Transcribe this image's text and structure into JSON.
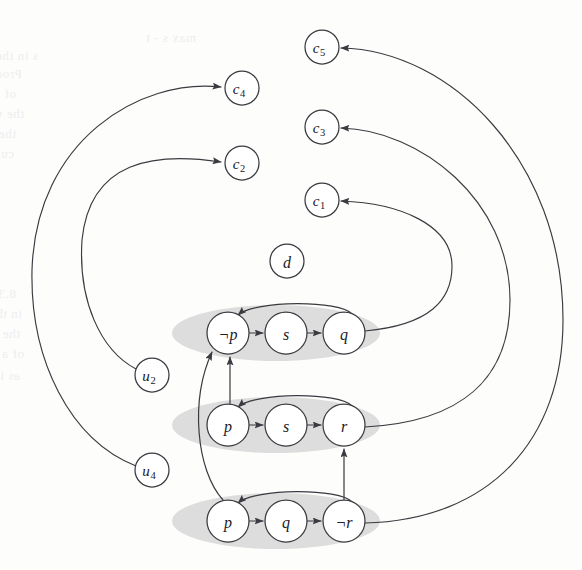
{
  "figure": {
    "background_color": "#fdfdfc",
    "cluster_fill": "#c9c9c9",
    "node_fill": "#ffffff",
    "stroke_color": "#3a3a40",
    "width": 582,
    "height": 570
  },
  "nodes": [
    {
      "id": "c5",
      "label": "c",
      "sub": "5",
      "cx": 322,
      "cy": 47,
      "r": 17,
      "group": "clause"
    },
    {
      "id": "c3",
      "label": "c",
      "sub": "3",
      "cx": 322,
      "cy": 127,
      "r": 17,
      "group": "clause"
    },
    {
      "id": "c1",
      "label": "c",
      "sub": "1",
      "cx": 322,
      "cy": 200,
      "r": 17,
      "group": "clause"
    },
    {
      "id": "c4",
      "label": "c",
      "sub": "4",
      "cx": 242,
      "cy": 88,
      "r": 17,
      "group": "clause"
    },
    {
      "id": "c2",
      "label": "c",
      "sub": "2",
      "cx": 242,
      "cy": 163,
      "r": 17,
      "group": "clause"
    },
    {
      "id": "d",
      "label": "d",
      "sub": "",
      "cx": 287,
      "cy": 261,
      "r": 17,
      "group": "isolated"
    },
    {
      "id": "u2",
      "label": "u",
      "sub": "2",
      "cx": 152,
      "cy": 375,
      "r": 17,
      "group": "unit"
    },
    {
      "id": "u4",
      "label": "u",
      "sub": "4",
      "cx": 152,
      "cy": 470,
      "r": 17,
      "group": "unit"
    },
    {
      "id": "n1a",
      "label": "¬p",
      "sub": "",
      "cx": 228,
      "cy": 333,
      "r": 21,
      "group": "scc1"
    },
    {
      "id": "n1b",
      "label": "s",
      "sub": "",
      "cx": 286,
      "cy": 333,
      "r": 21,
      "group": "scc1"
    },
    {
      "id": "n1c",
      "label": "q",
      "sub": "",
      "cx": 344,
      "cy": 333,
      "r": 21,
      "group": "scc1"
    },
    {
      "id": "n2a",
      "label": "p",
      "sub": "",
      "cx": 228,
      "cy": 425,
      "r": 21,
      "group": "scc2"
    },
    {
      "id": "n2b",
      "label": "s",
      "sub": "",
      "cx": 286,
      "cy": 425,
      "r": 21,
      "group": "scc2"
    },
    {
      "id": "n2c",
      "label": "r",
      "sub": "",
      "cx": 344,
      "cy": 425,
      "r": 21,
      "group": "scc2"
    },
    {
      "id": "n3a",
      "label": "p",
      "sub": "",
      "cx": 228,
      "cy": 521,
      "r": 21,
      "group": "scc3"
    },
    {
      "id": "n3b",
      "label": "q",
      "sub": "",
      "cx": 286,
      "cy": 521,
      "r": 21,
      "group": "scc3"
    },
    {
      "id": "n3c",
      "label": "¬r",
      "sub": "",
      "cx": 344,
      "cy": 521,
      "r": 21,
      "group": "scc3"
    }
  ],
  "clusters": [
    {
      "id": "scc1",
      "cx": 276,
      "cy": 333,
      "rx": 104,
      "ry": 28,
      "members": [
        "n1a",
        "n1b",
        "n1c"
      ]
    },
    {
      "id": "scc2",
      "cx": 276,
      "cy": 425,
      "rx": 104,
      "ry": 28,
      "members": [
        "n2a",
        "n2b",
        "n2c"
      ]
    },
    {
      "id": "scc3",
      "cx": 276,
      "cy": 521,
      "rx": 104,
      "ry": 28,
      "members": [
        "n3a",
        "n3b",
        "n3c"
      ]
    }
  ],
  "edges": [
    {
      "id": "e-np-s",
      "from": "n1a",
      "to": "n1b",
      "kind": "straight",
      "path": "M 249 333 L 263 333"
    },
    {
      "id": "e-s-q",
      "from": "n1b",
      "to": "n1c",
      "kind": "straight",
      "path": "M 307 333 L 321 333"
    },
    {
      "id": "e-q-np",
      "from": "n1c",
      "to": "n1a",
      "kind": "arc",
      "path": "M 352 314 C 340 300 255 300 238 315"
    },
    {
      "id": "e-p-s2",
      "from": "n2a",
      "to": "n2b",
      "kind": "straight",
      "path": "M 249 425 L 263 425"
    },
    {
      "id": "e-s-r",
      "from": "n2b",
      "to": "n2c",
      "kind": "straight",
      "path": "M 307 425 L 321 425"
    },
    {
      "id": "e-r-p",
      "from": "n2c",
      "to": "n2a",
      "kind": "arc",
      "path": "M 352 406 C 340 392 255 392 238 407"
    },
    {
      "id": "e-p-q3",
      "from": "n3a",
      "to": "n3b",
      "kind": "straight",
      "path": "M 249 521 L 263 521"
    },
    {
      "id": "e-q-nr",
      "from": "n3b",
      "to": "n3c",
      "kind": "straight",
      "path": "M 307 521 L 321 521"
    },
    {
      "id": "e-nr-p",
      "from": "n3c",
      "to": "n3a",
      "kind": "arc",
      "path": "M 352 502 C 340 488 255 488 238 503"
    },
    {
      "id": "e-p2-np1",
      "from": "n2a",
      "to": "n1a",
      "kind": "vertical",
      "path": "M 230 404 L 230 357"
    },
    {
      "id": "e-nr3-r2",
      "from": "n3c",
      "to": "n2c",
      "kind": "vertical",
      "path": "M 344 500 L 344 449"
    },
    {
      "id": "e-p3-np1",
      "from": "n3a",
      "to": "n1a",
      "kind": "curve",
      "path": "M 223 500 C 196 470 190 400 212 352"
    },
    {
      "id": "e-q-c1",
      "from": "n1c",
      "to": "c1",
      "kind": "long",
      "path": "M 365 331 C 430 325 452 300 452 266 C 452 225 400 203 341 201"
    },
    {
      "id": "e-r-c3",
      "from": "n2c",
      "to": "c3",
      "kind": "long",
      "path": "M 365 427 C 460 422 510 380 510 300 C 510 200 420 130 341 128"
    },
    {
      "id": "e-nr-c5",
      "from": "n3c",
      "to": "c5",
      "kind": "long",
      "path": "M 365 523 C 490 520 563 440 563 320 C 563 160 450 50 341 48"
    },
    {
      "id": "e-u2-c2",
      "from": "u2",
      "to": "c2",
      "kind": "long",
      "path": "M 136 369 C 100 350 78 300 82 240 C 90 160 155 152 221 162"
    },
    {
      "id": "e-u4-c4",
      "from": "u4",
      "to": "c4",
      "kind": "long",
      "path": "M 136 466 C 70 440 30 360 32 270 C 36 140 140 78 221 87"
    }
  ],
  "ghost_text": [
    {
      "text": "max s - t",
      "x": 196,
      "y": 30
    },
    {
      "text": "s in the in flow",
      "x": 38,
      "y": 48
    },
    {
      "text": "Proof. The  to be    induces  a",
      "x": 22,
      "y": 66
    },
    {
      "text": "of 7.1 at s and zero  in  the   nality",
      "x": 16,
      "y": 86
    },
    {
      "text": "the  variant of the   G  the  of",
      "x": 24,
      "y": 106
    },
    {
      "text": "the book  of a cut that  in the",
      "x": 16,
      "y": 126
    },
    {
      "text": "cut of G for each  Remains  a  cut",
      "x": 14,
      "y": 146
    },
    {
      "text": "8.3 is the  set  of  and",
      "x": 16,
      "y": 286
    },
    {
      "text": "in the  a  directed  of",
      "x": 22,
      "y": 306
    },
    {
      "text": "the  of  verification   that",
      "x": 20,
      "y": 326
    },
    {
      "text": "of  a  assign",
      "x": 24,
      "y": 346
    },
    {
      "text": "as  in  for",
      "x": 20,
      "y": 368
    }
  ]
}
